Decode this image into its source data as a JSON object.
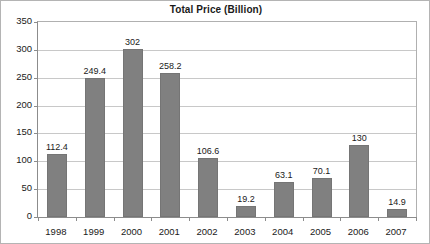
{
  "chart_data": {
    "type": "bar",
    "title": "Total Price (Billion)",
    "xlabel": "",
    "ylabel": "",
    "categories": [
      "1998",
      "1999",
      "2000",
      "2001",
      "2002",
      "2003",
      "2004",
      "2005",
      "2006",
      "2007"
    ],
    "values": [
      112.4,
      249.4,
      302,
      258.2,
      106.6,
      19.2,
      63.1,
      70.1,
      130,
      14.9
    ],
    "value_labels": [
      "112.4",
      "249.4",
      "302",
      "258.2",
      "106.6",
      "19.2",
      "63.1",
      "70.1",
      "130",
      "14.9"
    ],
    "ylim": [
      0,
      350
    ],
    "ytick_labels": [
      "0",
      "50",
      "100",
      "150",
      "200",
      "250",
      "300",
      "350"
    ],
    "ytick_values": [
      0,
      50,
      100,
      150,
      200,
      250,
      300,
      350
    ],
    "grid": true,
    "legend": "none",
    "series_color": "#808080",
    "grid_color": "#c8c8c8",
    "axis_color": "#8c8c8c",
    "text_color": "#1a1a1a"
  }
}
